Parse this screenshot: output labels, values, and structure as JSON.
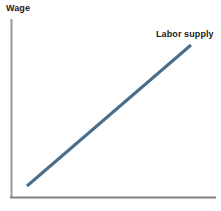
{
  "chart_data": {
    "type": "line",
    "title": "",
    "subtitle": "",
    "xlabel": "",
    "ylabel": "Wage",
    "xlim": [
      0,
      100
    ],
    "ylim": [
      0,
      100
    ],
    "grid": false,
    "legend_position": "inline-end-of-line",
    "annotations": [
      {
        "text": "Labor supply",
        "x": 88,
        "y": 92
      }
    ],
    "series": [
      {
        "name": "Labor supply",
        "color": "#4a6e8a",
        "line_width": 3,
        "x": [
          9,
          88
        ],
        "y": [
          7,
          84
        ],
        "points": [
          {
            "x": 9,
            "y": 7
          },
          {
            "x": 88,
            "y": 84
          }
        ]
      }
    ],
    "axes": {
      "y_axis_color": "#999999",
      "x_axis_color": "#808080",
      "y_axis_label": "Wage",
      "x_axis_label": "",
      "x_tick_labels": [],
      "y_tick_labels": []
    },
    "colors": {
      "background": "#ffffff",
      "line": "#4a6e8a",
      "text": "#1a1a1a",
      "axis": "#999999"
    }
  },
  "labels": {
    "y_axis_title": "Wage",
    "series_label": "Labor supply"
  }
}
